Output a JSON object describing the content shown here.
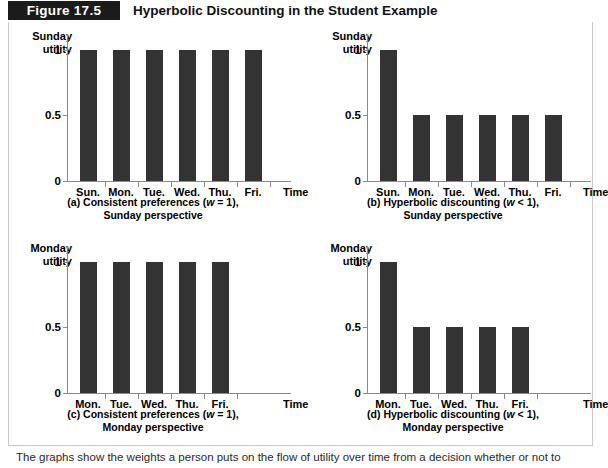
{
  "header": {
    "figure_number": "Figure 17.5",
    "title": "Hyperbolic Discounting in the Student Example"
  },
  "note": "The graphs show the weights a person puts on the flow of utility over time from a decision whether or not to",
  "axis": {
    "y_ticks": [
      "1",
      "0.5",
      "0"
    ],
    "time_label": "Time"
  },
  "panels": [
    {
      "id": "a",
      "y_axis_title_line1": "Sunday",
      "y_axis_title_line2": "utility",
      "caption_line1": "(a) Consistent preferences (w = 1),",
      "caption_line2": "Sunday perspective",
      "categories": [
        "Sun.",
        "Mon.",
        "Tue.",
        "Wed.",
        "Thu.",
        "Fri."
      ],
      "values": [
        1,
        1,
        1,
        1,
        1,
        1
      ]
    },
    {
      "id": "b",
      "y_axis_title_line1": "Sunday",
      "y_axis_title_line2": "utility",
      "caption_line1": "(b) Hyperbolic discounting (w < 1),",
      "caption_line2": "Sunday perspective",
      "categories": [
        "Sun.",
        "Mon.",
        "Tue.",
        "Wed.",
        "Thu.",
        "Fri."
      ],
      "values": [
        1,
        0.5,
        0.5,
        0.5,
        0.5,
        0.5
      ]
    },
    {
      "id": "c",
      "y_axis_title_line1": "Monday",
      "y_axis_title_line2": "utility",
      "caption_line1": "(c) Consistent preferences (w = 1),",
      "caption_line2": "Monday perspective",
      "categories": [
        "Mon.",
        "Tue.",
        "Wed.",
        "Thu.",
        "Fri."
      ],
      "values": [
        1,
        1,
        1,
        1,
        1
      ]
    },
    {
      "id": "d",
      "y_axis_title_line1": "Monday",
      "y_axis_title_line2": "utility",
      "caption_line1": "(d) Hyperbolic discounting (w < 1),",
      "caption_line2": "Monday perspective",
      "categories": [
        "Mon.",
        "Tue.",
        "Wed.",
        "Thu.",
        "Fri."
      ],
      "values": [
        1,
        0.5,
        0.5,
        0.5,
        0.5
      ]
    }
  ],
  "chart_data": [
    {
      "type": "bar",
      "title": "(a) Consistent preferences (w = 1), Sunday perspective",
      "categories": [
        "Sun.",
        "Mon.",
        "Tue.",
        "Wed.",
        "Thu.",
        "Fri."
      ],
      "values": [
        1,
        1,
        1,
        1,
        1,
        1
      ],
      "xlabel": "Time",
      "ylabel": "Sunday utility",
      "ylim": [
        0,
        1.12
      ],
      "yticks": [
        0,
        0.5,
        1
      ],
      "grid": false,
      "legend": "none"
    },
    {
      "type": "bar",
      "title": "(b) Hyperbolic discounting (w < 1), Sunday perspective",
      "categories": [
        "Sun.",
        "Mon.",
        "Tue.",
        "Wed.",
        "Thu.",
        "Fri."
      ],
      "values": [
        1,
        0.5,
        0.5,
        0.5,
        0.5,
        0.5
      ],
      "xlabel": "Time",
      "ylabel": "Sunday utility",
      "ylim": [
        0,
        1.12
      ],
      "yticks": [
        0,
        0.5,
        1
      ],
      "grid": false,
      "legend": "none"
    },
    {
      "type": "bar",
      "title": "(c) Consistent preferences (w = 1), Monday perspective",
      "categories": [
        "Mon.",
        "Tue.",
        "Wed.",
        "Thu.",
        "Fri."
      ],
      "values": [
        1,
        1,
        1,
        1,
        1
      ],
      "xlabel": "Time",
      "ylabel": "Monday utility",
      "ylim": [
        0,
        1.12
      ],
      "yticks": [
        0,
        0.5,
        1
      ],
      "grid": false,
      "legend": "none"
    },
    {
      "type": "bar",
      "title": "(d) Hyperbolic discounting (w < 1), Monday perspective",
      "categories": [
        "Mon.",
        "Tue.",
        "Wed.",
        "Thu.",
        "Fri."
      ],
      "values": [
        1,
        0.5,
        0.5,
        0.5,
        0.5
      ],
      "xlabel": "Time",
      "ylabel": "Monday utility",
      "ylim": [
        0,
        1.12
      ],
      "yticks": [
        0,
        0.5,
        1
      ],
      "grid": false,
      "legend": "none"
    }
  ],
  "colors": {
    "bar": "#333333",
    "axis": "#8a8a8a",
    "chip_background": "#1b1b1b",
    "chip_text": "#ffffff",
    "frame_border": "#c9c9c9"
  }
}
